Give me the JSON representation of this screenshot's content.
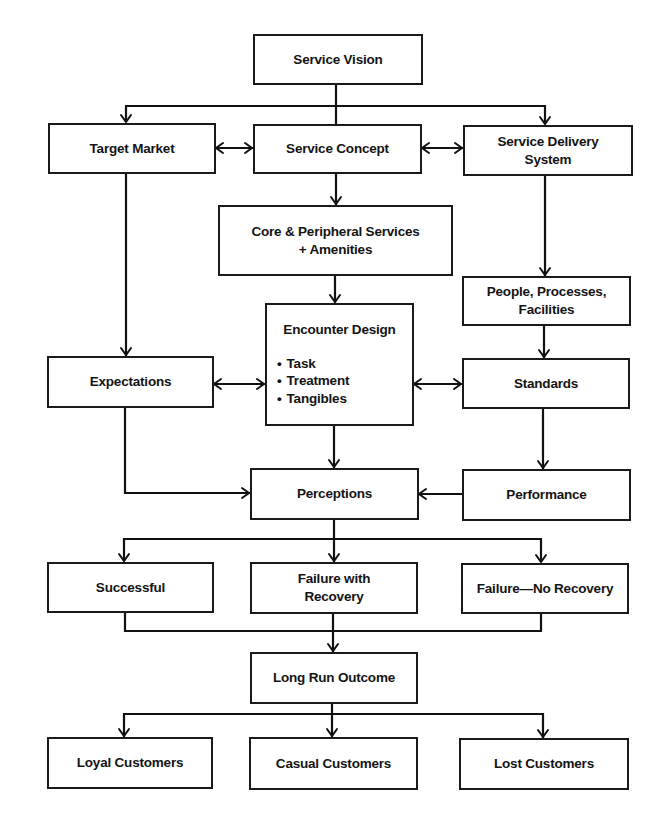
{
  "diagram": {
    "type": "flowchart",
    "nodes": {
      "service_vision": {
        "lines": [
          "Service Vision"
        ]
      },
      "target_market": {
        "lines": [
          "Target Market"
        ]
      },
      "service_concept": {
        "lines": [
          "Service Concept"
        ]
      },
      "service_delivery_system": {
        "lines": [
          "Service Delivery",
          "System"
        ]
      },
      "core_peripheral": {
        "lines": [
          "Core & Peripheral Services",
          "+ Amenities"
        ]
      },
      "people_processes": {
        "lines": [
          "People, Processes,",
          "Facilities"
        ]
      },
      "encounter_design": {
        "title": "Encounter Design",
        "bullets": [
          "Task",
          "Treatment",
          "Tangibles"
        ]
      },
      "expectations": {
        "lines": [
          "Expectations"
        ]
      },
      "standards": {
        "lines": [
          "Standards"
        ]
      },
      "perceptions": {
        "lines": [
          "Perceptions"
        ]
      },
      "performance": {
        "lines": [
          "Performance"
        ]
      },
      "successful": {
        "lines": [
          "Successful"
        ]
      },
      "failure_with_recovery": {
        "lines": [
          "Failure with",
          "Recovery"
        ]
      },
      "failure_no_recovery": {
        "lines": [
          "Failure—No Recovery"
        ]
      },
      "long_run_outcome": {
        "lines": [
          "Long Run Outcome"
        ]
      },
      "loyal_customers": {
        "lines": [
          "Loyal Customers"
        ]
      },
      "casual_customers": {
        "lines": [
          "Casual Customers"
        ]
      },
      "lost_customers": {
        "lines": [
          "Lost Customers"
        ]
      }
    },
    "edges": [
      {
        "from": "service_vision",
        "to": "target_market",
        "type": "arrow"
      },
      {
        "from": "service_vision",
        "to": "service_concept",
        "type": "line"
      },
      {
        "from": "service_vision",
        "to": "service_delivery_system",
        "type": "arrow"
      },
      {
        "from": "target_market",
        "to": "service_concept",
        "type": "bidirectional"
      },
      {
        "from": "service_concept",
        "to": "service_delivery_system",
        "type": "bidirectional"
      },
      {
        "from": "service_concept",
        "to": "core_peripheral",
        "type": "arrow"
      },
      {
        "from": "service_delivery_system",
        "to": "people_processes",
        "type": "arrow"
      },
      {
        "from": "core_peripheral",
        "to": "encounter_design",
        "type": "arrow"
      },
      {
        "from": "target_market",
        "to": "expectations",
        "type": "arrow"
      },
      {
        "from": "people_processes",
        "to": "standards",
        "type": "arrow"
      },
      {
        "from": "expectations",
        "to": "encounter_design",
        "type": "bidirectional"
      },
      {
        "from": "encounter_design",
        "to": "standards",
        "type": "bidirectional"
      },
      {
        "from": "encounter_design",
        "to": "perceptions",
        "type": "arrow"
      },
      {
        "from": "expectations",
        "to": "perceptions",
        "type": "arrow"
      },
      {
        "from": "standards",
        "to": "performance",
        "type": "arrow"
      },
      {
        "from": "performance",
        "to": "perceptions",
        "type": "arrow"
      },
      {
        "from": "perceptions",
        "to": "successful",
        "type": "arrow"
      },
      {
        "from": "perceptions",
        "to": "failure_with_recovery",
        "type": "arrow"
      },
      {
        "from": "perceptions",
        "to": "failure_no_recovery",
        "type": "arrow"
      },
      {
        "from": "successful",
        "to": "long_run_outcome",
        "type": "arrow"
      },
      {
        "from": "failure_with_recovery",
        "to": "long_run_outcome",
        "type": "arrow"
      },
      {
        "from": "failure_no_recovery",
        "to": "long_run_outcome",
        "type": "arrow"
      },
      {
        "from": "long_run_outcome",
        "to": "loyal_customers",
        "type": "arrow"
      },
      {
        "from": "long_run_outcome",
        "to": "casual_customers",
        "type": "arrow"
      },
      {
        "from": "long_run_outcome",
        "to": "lost_customers",
        "type": "arrow"
      }
    ]
  }
}
